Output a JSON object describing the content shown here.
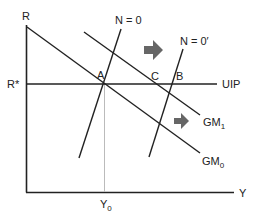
{
  "diagram": {
    "type": "IS-LM style macro diagram (GM / UIP / N=0)",
    "axes": {
      "y_label": "R",
      "x_label": "Y",
      "y_tick_label": "R*",
      "x_tick_label": "Y",
      "x_tick_sub": "0"
    },
    "curves": {
      "uip_label": "UIP",
      "gm0_label": "GM",
      "gm0_sub": "0",
      "gm1_label": "GM",
      "gm1_sub": "1",
      "n0_label": "N = 0",
      "n0prime_label": "N = 0′"
    },
    "points": {
      "a": "A",
      "b": "B",
      "c": "C"
    },
    "colors": {
      "line": "#222222",
      "arrow": "#666666",
      "guide": "#bbbbbb"
    }
  }
}
